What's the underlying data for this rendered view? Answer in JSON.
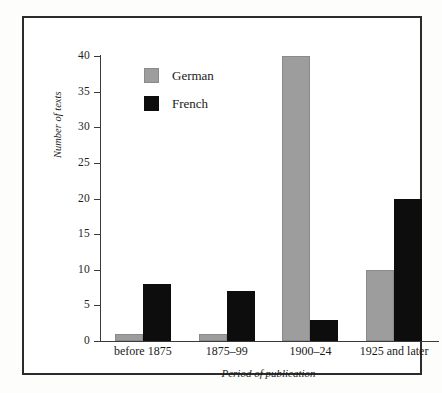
{
  "chart_data": {
    "type": "bar",
    "title": "",
    "subtitle": "",
    "xlabel": "Period of publication",
    "ylabel": "Number of texts",
    "categories": [
      "before 1875",
      "1875–99",
      "1900–24",
      "1925 and later"
    ],
    "series": [
      {
        "name": "German",
        "color": "#9d9d9d",
        "values": [
          1,
          1,
          40,
          10
        ]
      },
      {
        "name": "French",
        "color": "#0d0d0d",
        "values": [
          8,
          7,
          3,
          20
        ]
      }
    ],
    "ylim": [
      0,
      40
    ],
    "yticks": [
      0,
      5,
      10,
      15,
      20,
      25,
      30,
      35,
      40
    ],
    "ytick_labels": [
      "0",
      "5",
      "10",
      "15",
      "20",
      "25",
      "30",
      "35",
      "40"
    ],
    "grid": false,
    "legend_position": "upper-left-inside",
    "legend": [
      {
        "label": "German",
        "swatch": "german-legend-swatch"
      },
      {
        "label": "French",
        "swatch": "french-legend-swatch"
      }
    ],
    "annotations": []
  },
  "figure": {
    "border_color": "#2b2b2b",
    "background": "#ffffff",
    "axis_color": "#3a3a3a"
  }
}
